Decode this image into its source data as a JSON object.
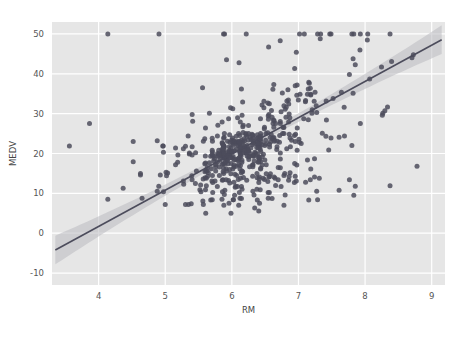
{
  "figure": {
    "background_color": "#ffffff",
    "plot_background_color": "#e6e6e6",
    "grid_color": "#ffffff",
    "point_color": "#4c4c5c",
    "line_color": "#4c4c5c",
    "band_color": "#b9b9c0"
  },
  "chart_data": {
    "type": "scatter",
    "title": "",
    "xlabel": "RM",
    "ylabel": "MEDV",
    "xlim": [
      3.3,
      9.2
    ],
    "ylim": [
      -13,
      53
    ],
    "xticks": [
      4,
      5,
      6,
      7,
      8,
      9
    ],
    "xtick_labels": [
      "4",
      "5",
      "6",
      "7",
      "8",
      "9"
    ],
    "yticks": [
      -10,
      0,
      10,
      20,
      30,
      40,
      50
    ],
    "ytick_labels": [
      "-10",
      "0",
      "10",
      "20",
      "30",
      "40",
      "50"
    ],
    "grid": true,
    "legend": null,
    "regression": {
      "type": "linear",
      "slope": 9.1,
      "intercept": -34.7,
      "x_start": 3.35,
      "x_end": 9.15,
      "ci_band": true,
      "ci_halfwidth_center": 0.9,
      "ci_halfwidth_edge": 3.6
    },
    "x": [
      6.575,
      6.421,
      7.185,
      6.998,
      7.147,
      6.43,
      6.012,
      6.172,
      5.631,
      6.004,
      6.377,
      6.009,
      5.889,
      5.949,
      6.096,
      5.834,
      5.935,
      5.99,
      5.456,
      5.727,
      5.57,
      5.965,
      6.142,
      5.813,
      5.924,
      5.599,
      5.813,
      6.047,
      6.495,
      6.674,
      5.713,
      6.072,
      5.95,
      5.701,
      6.096,
      5.933,
      5.841,
      5.85,
      5.966,
      6.595,
      7.024,
      6.77,
      6.169,
      6.211,
      6.069,
      5.682,
      5.786,
      6.03,
      5.399,
      5.602,
      5.963,
      6.115,
      6.511,
      5.998,
      5.888,
      7.249,
      6.383,
      6.816,
      6.145,
      5.927,
      5.741,
      5.966,
      6.456,
      6.762,
      7.104,
      6.29,
      5.787,
      5.878,
      5.594,
      5.885,
      6.417,
      5.961,
      6.065,
      6.245,
      6.273,
      6.286,
      6.279,
      6.14,
      6.232,
      5.874,
      6.727,
      6.619,
      6.302,
      6.167,
      6.389,
      6.63,
      6.015,
      6.121,
      7.007,
      7.079,
      6.417,
      6.405,
      6.442,
      6.211,
      6.249,
      6.625,
      6.163,
      8.069,
      7.82,
      7.416,
      6.727,
      6.781,
      6.405,
      6.137,
      6.167,
      5.851,
      5.836,
      6.127,
      6.474,
      6.229,
      6.195,
      6.715,
      5.913,
      6.092,
      6.254,
      5.928,
      6.176,
      6.021,
      5.872,
      5.731,
      5.87,
      6.004,
      5.961,
      5.856,
      5.879,
      5.986,
      5.613,
      5.693,
      6.431,
      5.637,
      6.458,
      6.326,
      6.372,
      5.822,
      5.757,
      6.335,
      5.942,
      6.454,
      5.857,
      6.151,
      6.174,
      5.019,
      5.403,
      5.468,
      4.903,
      6.13,
      5.628,
      4.926,
      5.186,
      5.597,
      6.122,
      5.404,
      5.012,
      5.709,
      6.129,
      6.152,
      5.272,
      6.943,
      6.066,
      6.51,
      6.25,
      7.489,
      7.802,
      8.375,
      5.854,
      6.101,
      7.929,
      5.877,
      6.319,
      6.402,
      5.875,
      5.88,
      5.572,
      6.416,
      5.859,
      6.546,
      6.02,
      6.315,
      6.86,
      6.98,
      7.765,
      6.144,
      7.155,
      6.563,
      5.604,
      6.153,
      7.831,
      6.782,
      6.556,
      7.185,
      6.951,
      6.739,
      7.178,
      6.8,
      6.604,
      7.287,
      7.107,
      7.274,
      6.975,
      7.135,
      6.162,
      7.61,
      7.853,
      8.034,
      5.891,
      6.326,
      5.783,
      6.064,
      5.344,
      5.96,
      5.404,
      5.807,
      6.375,
      5.412,
      6.182,
      5.888,
      6.642,
      5.951,
      6.373,
      6.951,
      6.164,
      6.879,
      6.618,
      8.266,
      8.725,
      8.04,
      7.163,
      7.686,
      6.552,
      5.981,
      7.412,
      8.337,
      8.247,
      6.726,
      6.086,
      6.631,
      7.358,
      6.481,
      6.606,
      6.897,
      6.095,
      6.358,
      6.393,
      5.593,
      5.605,
      6.108,
      6.226,
      6.433,
      6.718,
      6.487,
      6.438,
      6.957,
      8.259,
      6.108,
      5.876,
      7.454,
      8.704,
      7.333,
      6.842,
      7.203,
      7.52,
      8.398,
      7.327,
      7.206,
      5.56,
      7.014,
      8.297,
      7.47,
      5.92,
      5.856,
      6.24,
      6.538,
      7.691,
      6.758,
      6.854,
      7.267,
      6.826,
      6.482,
      6.812,
      7.82,
      6.968,
      7.645,
      7.923,
      7.088,
      6.453,
      6.23,
      6.209,
      6.315,
      6.565,
      6.861,
      7.148,
      6.63,
      6.127,
      6.009,
      6.678,
      6.549,
      5.79,
      6.345,
      7.041,
      6.871,
      6.59,
      6.495,
      6.982,
      7.236,
      6.616,
      7.42,
      6.849,
      6.635,
      5.972,
      4.973,
      6.122,
      6.023,
      6.266,
      6.567,
      5.705,
      5.914,
      5.782,
      6.382,
      6.113,
      6.426,
      6.376,
      6.041,
      5.708,
      6.415,
      6.431,
      6.312,
      6.083,
      5.868,
      6.333,
      6.144,
      5.706,
      6.031,
      6.316,
      6.31,
      6.037,
      5.869,
      5.895,
      6.059,
      5.985,
      5.968,
      7.241,
      6.54,
      6.696,
      6.874,
      6.014,
      5.898,
      6.516,
      6.635,
      6.939,
      6.49,
      6.579,
      5.884,
      6.728,
      5.663,
      5.936,
      6.212,
      6.395,
      6.127,
      6.112,
      6.398,
      6.251,
      5.362,
      5.803,
      8.78,
      3.561,
      4.963,
      3.863,
      4.97,
      6.683,
      7.016,
      6.216,
      5.875,
      4.906,
      4.138,
      7.313,
      6.649,
      6.794,
      6.38,
      6.223,
      6.968,
      6.545,
      5.536,
      5.52,
      4.368,
      5.277,
      4.652,
      5,
      4.88,
      5.39,
      5.713,
      6.051,
      5.036,
      6.193,
      5.887,
      6.471,
      6.405,
      5.747,
      5.453,
      5.852,
      5.987,
      6.343,
      6.404,
      5.349,
      5.531,
      5.683,
      4.138,
      5.608,
      5.617,
      6.852,
      5.757,
      6.657,
      4.628,
      5.155,
      4.519,
      6.434,
      6.782,
      5.304,
      5.957,
      4.973,
      6.122,
      6.023,
      6.266,
      6.567,
      5.705,
      5.914,
      5.782,
      6.382,
      6.113,
      6.426,
      6.376,
      6.041,
      5.708,
      6.415,
      6.431,
      6.312,
      6.083,
      5.868,
      6.333,
      6.144,
      5.706,
      6.031,
      6.316,
      6.31,
      6.037,
      5.869,
      5.895,
      6.059,
      5.985,
      5.968,
      7.241,
      6.54,
      6.696,
      6.874,
      6.014,
      5.898,
      6.516,
      6.635,
      6.939,
      6.49,
      6.579,
      5.884,
      6.728,
      5.663,
      5.936,
      6.212,
      6.395,
      6.127,
      6.112,
      6.398,
      6.251,
      5.362,
      5.803,
      5.19,
      4.88,
      5.404,
      5.617,
      6.852,
      5.757,
      6.657,
      4.628,
      5.155,
      4.519,
      6.434,
      6.782,
      5.304,
      5.957,
      6.824,
      6.411,
      6.006,
      5.648,
      6.103,
      5.565,
      6.41,
      6.728,
      6.19,
      6.12,
      5.709,
      6.129,
      6.152,
      5.272,
      6.943,
      6.066,
      6.51,
      6.25,
      7.489,
      7.802,
      8.375,
      5.854,
      6.101,
      7.929,
      5.877,
      6.319,
      6.402,
      5.875,
      5.88,
      5.572,
      6.416,
      5.859,
      6.546,
      6.02,
      6.315,
      6.86,
      6.98,
      7.765,
      6.144,
      7.155,
      6.563,
      5.604,
      6.153,
      7.831,
      6.782,
      6.556,
      7.185,
      6.951,
      6.739,
      7.178,
      6.8,
      6.604,
      7.287,
      7.107,
      7.274,
      6.975,
      7.135,
      6.162,
      7.61,
      7.853
    ],
    "y": [
      24,
      21.6,
      34.7,
      33.4,
      36.2,
      28.7,
      22.9,
      27.1,
      16.5,
      18.9,
      15,
      18.9,
      21.7,
      20.4,
      18.2,
      19.9,
      23.1,
      17.5,
      20.2,
      18.2,
      13.6,
      19.6,
      15.2,
      14.5,
      15.6,
      13.9,
      16.6,
      14.8,
      18.4,
      21,
      12.7,
      14.5,
      13.2,
      13.1,
      13.5,
      18.9,
      20,
      21,
      24.7,
      30.8,
      34.9,
      26.6,
      25.3,
      24.7,
      21.2,
      19.3,
      20,
      16.6,
      14.4,
      19.4,
      19.7,
      20.5,
      25,
      23.4,
      18.9,
      35.4,
      24.7,
      31.6,
      23.3,
      19.6,
      18.7,
      16,
      22.2,
      25,
      33,
      23.5,
      19.4,
      22,
      17.4,
      20.9,
      24.2,
      21.7,
      22.8,
      23.4,
      24.1,
      21.4,
      20,
      20.8,
      21.2,
      20.3,
      28,
      23.9,
      24.8,
      22.9,
      23.9,
      26.6,
      22.5,
      22.2,
      23.6,
      28.7,
      22.6,
      22,
      22.9,
      25,
      20.6,
      28.4,
      21.4,
      38.7,
      43.8,
      33.2,
      27.5,
      26.5,
      18.6,
      19.3,
      20.1,
      19.5,
      19.5,
      20.4,
      19.8,
      19.4,
      21.7,
      22.8,
      18.8,
      18.7,
      18.5,
      18.3,
      21.2,
      19.2,
      20.4,
      19.3,
      22,
      20.3,
      20.5,
      17.3,
      18.8,
      21.4,
      15.7,
      16.2,
      18,
      14.3,
      19.2,
      19.6,
      23,
      18.4,
      15.6,
      18.1,
      17.4,
      17.1,
      13.3,
      17.8,
      14,
      14.4,
      13.4,
      15.6,
      11.8,
      13.8,
      15.6,
      14.6,
      17.8,
      15.4,
      21.5,
      19.6,
      15.3,
      19.4,
      17,
      15.6,
      13.1,
      41.3,
      24.3,
      23.3,
      27,
      50,
      50,
      50,
      22.7,
      25,
      50,
      23.8,
      23.8,
      22.3,
      17.4,
      19.1,
      23.1,
      23.6,
      22.6,
      29.4,
      23.2,
      24.6,
      29.9,
      37.2,
      39.8,
      36.2,
      37.9,
      32.5,
      26.4,
      29.6,
      50,
      32,
      29.8,
      34.9,
      37,
      30.5,
      36.4,
      31.1,
      29.1,
      50,
      33.3,
      30.3,
      34.6,
      34.9,
      32.9,
      24.1,
      42.3,
      48.5,
      50,
      22.6,
      24.4,
      22.5,
      24.4,
      20,
      21.7,
      19.3,
      22.4,
      28.1,
      23.7,
      25,
      23.3,
      28.7,
      21.5,
      23,
      26.7,
      21.7,
      27.5,
      30.1,
      44.8,
      50,
      37.6,
      31.6,
      46.7,
      31.5,
      24.3,
      31.7,
      41.7,
      48.3,
      29,
      24,
      25.1,
      31.5,
      23.7,
      23.3,
      22,
      20.1,
      22.2,
      23.7,
      17.6,
      18.5,
      24.3,
      20.5,
      24.5,
      26.2,
      24.4,
      24.8,
      29.6,
      42.8,
      21.9,
      20.9,
      44,
      50,
      36,
      30.1,
      33.8,
      43.1,
      48.8,
      31,
      36.5,
      22.8,
      30.7,
      50,
      43.5,
      20.7,
      21.1,
      25.2,
      24.4,
      35.2,
      32.4,
      32,
      33.2,
      33.1,
      29.1,
      35.1,
      45.4,
      35.4,
      46,
      50,
      32.2,
      22,
      20.1,
      23.2,
      22.3,
      24.8,
      28.5,
      37.3,
      27.9,
      23.9,
      21.7,
      28.6,
      27.1,
      20.3,
      22.5,
      29,
      24.8,
      22,
      26.4,
      33.1,
      36.1,
      28.4,
      33.4,
      28.2,
      22.8,
      20.3,
      16.1,
      22.1,
      19.4,
      21.6,
      23.8,
      16.2,
      17.8,
      19.8,
      23.1,
      21,
      23.8,
      23.1,
      20.4,
      18.5,
      25,
      24.6,
      23,
      22.2,
      19.3,
      22.6,
      19.8,
      17.1,
      19.4,
      22.2,
      20.7,
      21.1,
      19.5,
      18.5,
      20.6,
      19,
      18.7,
      32.7,
      16.5,
      23.9,
      31.2,
      17.5,
      17.2,
      23.1,
      24.5,
      26.6,
      22.9,
      24.1,
      18.6,
      30.1,
      18.2,
      20.6,
      17.8,
      21.7,
      22.7,
      22.6,
      25,
      19.9,
      20.8,
      16.8,
      21.9,
      21.9,
      27.5,
      21.9,
      23.1,
      50,
      50,
      50,
      50,
      50,
      13.8,
      13.8,
      15,
      13.9,
      13.3,
      13.1,
      10.2,
      10.4,
      10.9,
      11.3,
      12.3,
      8.8,
      7.2,
      10.5,
      7.4,
      10.2,
      11.5,
      15.1,
      23.2,
      9.7,
      13.8,
      12.7,
      13.1,
      12.5,
      8.5,
      5,
      6.3,
      5.6,
      7.2,
      12.1,
      8.3,
      8.5,
      5,
      11.9,
      27.9,
      17.2,
      27.5,
      15,
      17.2,
      17.9,
      16.3,
      7,
      7.2,
      7.5,
      10.4,
      8.8,
      8.4,
      16.7,
      14.2,
      20.8,
      13.4,
      11.7,
      8.3,
      10.2,
      10.9,
      11,
      9.5,
      14.5,
      14.1,
      16.1,
      14.3,
      11.7,
      13.4,
      9.6,
      8.7,
      8.4,
      12.8,
      10.5,
      17.1,
      18.4,
      15.4,
      10.8,
      11.8,
      14.9,
      12.6,
      14.1,
      13,
      13.4,
      15.2,
      16.1,
      17.8,
      14.9,
      14.1,
      12.7,
      13.5,
      14.9,
      20,
      16.4,
      17.7,
      19.5,
      20.2,
      21.4,
      19.9,
      19,
      19.1,
      19.1,
      20.1,
      19.9,
      19.6,
      23.2,
      29.8,
      13.8,
      13.3,
      16.7,
      12,
      14.6,
      21.4,
      23,
      23.7,
      25,
      21.8,
      20.6,
      21.2,
      19.1,
      20.6,
      15.2,
      7,
      8.1,
      13.6,
      20.1,
      21.8,
      24.5,
      23.1,
      19.7,
      18.3,
      21.2,
      17.5,
      16.8,
      22.4,
      20.6,
      23.9,
      22,
      11.9,
      27.9,
      17.2,
      27.5,
      15,
      17.2,
      17.9,
      16.3,
      7,
      7.2,
      7.5,
      10.4,
      8.8,
      8.4,
      16.7,
      14.2,
      20.8,
      13.4,
      11.7,
      8.3,
      10.2,
      10.9,
      11,
      9.5,
      14.5,
      14.1,
      16.1,
      14.3,
      11.7,
      13.4,
      9.6,
      8.7,
      8.4,
      12.8,
      10.5,
      17.1,
      18.4,
      15.4,
      10.8,
      11.8,
      14.9,
      12.6,
      14.1,
      13,
      13.4,
      15.2,
      16.1,
      17.8,
      14.9,
      14.1,
      12.7,
      13.5,
      14.9,
      20,
      16.4,
      17.7
    ]
  }
}
